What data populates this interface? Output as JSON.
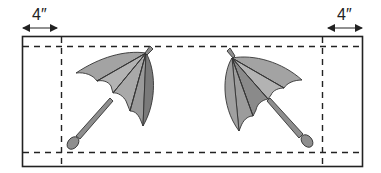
{
  "diagram": {
    "left_margin_label": "4″",
    "right_margin_label": "4″",
    "colors": {
      "outline": "#222222",
      "canopy_light": "#a9a9a9",
      "canopy_mid": "#8c8c8c",
      "canopy_dark": "#767676",
      "handle": "#8e8e8e"
    },
    "elements": [
      "outer-border",
      "fold-line-left",
      "fold-line-right",
      "fold-line-top",
      "fold-line-bottom",
      "umbrella-left",
      "umbrella-right"
    ]
  }
}
